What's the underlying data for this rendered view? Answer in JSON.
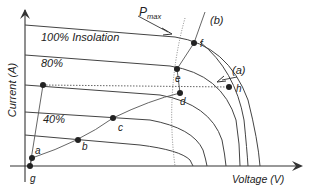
{
  "diagram": {
    "type": "pv-iv-curves",
    "axes": {
      "y_label": "Current (A)",
      "x_label": "Voltage (V)"
    },
    "curve_labels": {
      "c100": "100% Insolation",
      "c80": "80%",
      "c40": "40%"
    },
    "pmax_label": "P",
    "pmax_sub": "max",
    "line_labels": {
      "a": "(a)",
      "b": "(b)"
    },
    "points": {
      "a": "a",
      "b": "b",
      "c": "c",
      "d": "d",
      "e": "e",
      "f": "f",
      "g": "g",
      "h": "h"
    },
    "colors": {
      "ink": "#333333",
      "background": "#ffffff"
    }
  }
}
